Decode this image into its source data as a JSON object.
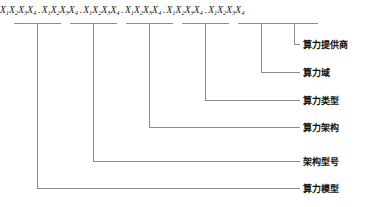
{
  "diagram": {
    "type": "bracket-annotation",
    "stroke_color": "#8c8c8c",
    "text_color": "#1a1a1a",
    "background": "#ffffff",
    "code": {
      "separator": ".",
      "group_text": "X1X2X3X4",
      "group_count": 6,
      "groups": [
        {
          "index": 1,
          "symbols": [
            "X1",
            "X2",
            "X3",
            "X4"
          ],
          "maps_to": "算力模型"
        },
        {
          "index": 2,
          "symbols": [
            "X1",
            "X2",
            "X3",
            "X4"
          ],
          "maps_to": "架构型号"
        },
        {
          "index": 3,
          "symbols": [
            "X1",
            "X2",
            "X3",
            "X4"
          ],
          "maps_to": "算力架构"
        },
        {
          "index": 4,
          "symbols": [
            "X1",
            "X2",
            "X3",
            "X4"
          ],
          "maps_to": "算力类型"
        },
        {
          "index": 5,
          "symbols": [
            "X1",
            "X2",
            "X3",
            "X4"
          ],
          "maps_to": "算力域"
        },
        {
          "index": 6,
          "symbols": [
            "X1",
            "X2",
            "X3",
            "X4"
          ],
          "maps_to": "算力提供商"
        }
      ]
    },
    "labels": [
      {
        "id": "provider",
        "text": "算力提供商",
        "group": 6
      },
      {
        "id": "domain",
        "text": "算力域",
        "group": 5
      },
      {
        "id": "type",
        "text": "算力类型",
        "group": 4
      },
      {
        "id": "architecture",
        "text": "算力架构",
        "group": 3
      },
      {
        "id": "arch-model",
        "text": "架构型号",
        "group": 2
      },
      {
        "id": "model",
        "text": "算力模型",
        "group": 1
      }
    ]
  }
}
